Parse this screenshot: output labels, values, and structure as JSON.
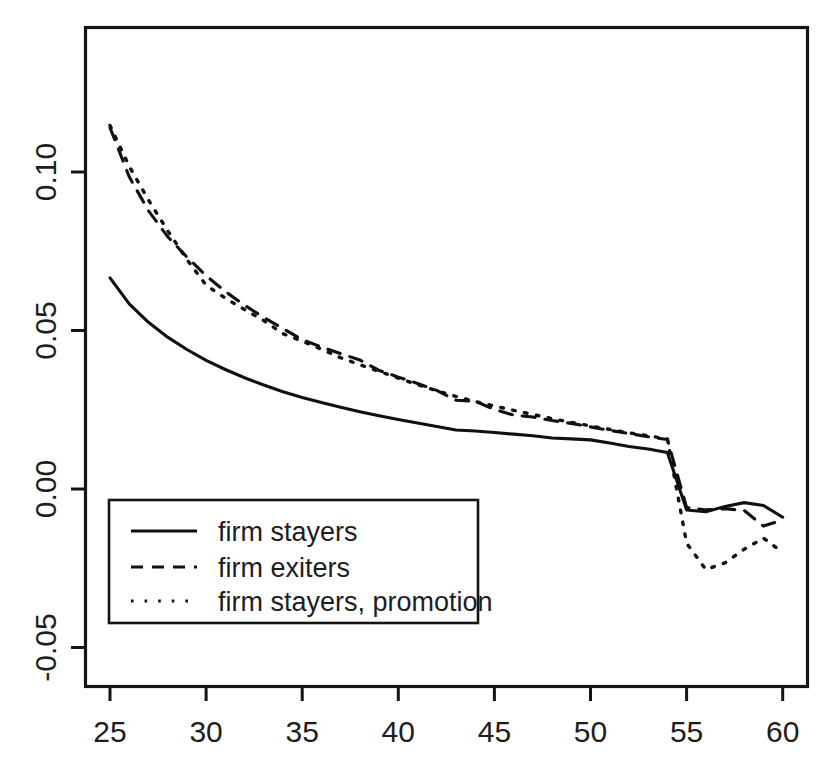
{
  "chart_data": {
    "type": "line",
    "title": "",
    "subtitle": "",
    "xlabel": "",
    "ylabel": "",
    "xlim": [
      24.3,
      60.9
    ],
    "ylim": [
      -0.062,
      0.128
    ],
    "grid": false,
    "legend_position": "bottom-left",
    "x_ticks": [
      25,
      30,
      35,
      40,
      45,
      50,
      55,
      60
    ],
    "x_tick_labels": [
      "25",
      "30",
      "35",
      "40",
      "45",
      "50",
      "55",
      "60"
    ],
    "y_ticks": [
      -0.05,
      0.0,
      0.05,
      0.1
    ],
    "y_tick_labels": [
      "-0.05",
      "0.00",
      "0.05",
      "0.10"
    ],
    "x": [
      25,
      26,
      27,
      28,
      29,
      30,
      31,
      32,
      33,
      34,
      35,
      36,
      37,
      38,
      39,
      40,
      41,
      42,
      43,
      44,
      45,
      46,
      47,
      48,
      49,
      50,
      51,
      52,
      53,
      54,
      55,
      56,
      57,
      58,
      59,
      60
    ],
    "series": [
      {
        "name": "firm stayers",
        "style": "solid",
        "color": "#101010",
        "values": [
          0.0666,
          0.0584,
          0.0526,
          0.0479,
          0.044,
          0.0406,
          0.0377,
          0.0351,
          0.0328,
          0.0307,
          0.0289,
          0.0273,
          0.0258,
          0.0244,
          0.0231,
          0.0219,
          0.0208,
          0.0197,
          0.0186,
          0.0183,
          0.0178,
          0.0173,
          0.0168,
          0.0161,
          0.0158,
          0.0155,
          0.0145,
          0.0134,
          0.0126,
          0.0115,
          -0.0066,
          -0.0072,
          -0.0055,
          -0.0043,
          -0.0052,
          -0.0089
        ]
      },
      {
        "name": "firm exiters",
        "style": "dashed",
        "color": "#101010",
        "values": [
          0.114,
          0.0985,
          0.0878,
          0.0796,
          0.0732,
          0.0673,
          0.0623,
          0.058,
          0.0541,
          0.0506,
          0.0471,
          0.0448,
          0.0427,
          0.0407,
          0.0374,
          0.0353,
          0.0333,
          0.0311,
          0.028,
          0.0277,
          0.0251,
          0.0233,
          0.0227,
          0.0216,
          0.0207,
          0.0196,
          0.0185,
          0.0175,
          0.0165,
          0.0156,
          -0.0058,
          -0.0066,
          -0.0062,
          -0.0068,
          -0.0117,
          -0.0098
        ]
      },
      {
        "name": "firm stayers, promotion",
        "style": "dotted",
        "color": "#101010",
        "values": [
          0.1147,
          0.1018,
          0.0912,
          0.0815,
          0.0724,
          0.0643,
          0.0602,
          0.0566,
          0.0531,
          0.049,
          0.0466,
          0.0441,
          0.0414,
          0.0392,
          0.0371,
          0.035,
          0.0329,
          0.031,
          0.0292,
          0.0276,
          0.0262,
          0.0248,
          0.0235,
          0.0222,
          0.021,
          0.0199,
          0.0188,
          0.0177,
          0.0168,
          0.0158,
          -0.0171,
          -0.0254,
          -0.0233,
          -0.019,
          -0.0155,
          -0.02
        ]
      }
    ]
  },
  "legend": {
    "entries": [
      {
        "label": "firm stayers",
        "style": "solid"
      },
      {
        "label": "firm exiters",
        "style": "dashed"
      },
      {
        "label": "firm stayers, promotion",
        "style": "dotted"
      }
    ]
  },
  "axes": {
    "x_tick_labels": [
      "25",
      "30",
      "35",
      "40",
      "45",
      "50",
      "55",
      "60"
    ],
    "y_tick_labels": [
      "0.10",
      "0.05",
      "0.00",
      "-0.05"
    ]
  }
}
